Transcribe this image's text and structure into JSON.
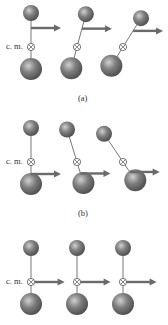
{
  "figure": {
    "cm_label": "c. m.",
    "panels": [
      {
        "id": "a",
        "label": "(a)",
        "description": "Force applied above center of mass: object rotates and translates",
        "frames": [
          {
            "tilt_deg": 0,
            "force_at": "above-cm"
          },
          {
            "tilt_deg": 15,
            "force_at": "above-cm"
          },
          {
            "tilt_deg": 32,
            "force_at": "above-cm"
          }
        ]
      },
      {
        "id": "b",
        "label": "(b)",
        "description": "Force applied below center of mass: object rotates the other way and translates",
        "frames": [
          {
            "tilt_deg": 0,
            "force_at": "below-cm"
          },
          {
            "tilt_deg": -17,
            "force_at": "below-cm"
          },
          {
            "tilt_deg": -34,
            "force_at": "below-cm"
          }
        ]
      },
      {
        "id": "c",
        "label": "",
        "description": "Force applied at center of mass: pure translation",
        "frames": [
          {
            "tilt_deg": 0,
            "force_at": "cm"
          },
          {
            "tilt_deg": 0,
            "force_at": "cm"
          },
          {
            "tilt_deg": 0,
            "force_at": "cm"
          }
        ]
      }
    ],
    "colors": {
      "sphere": "#6e6e6e",
      "sphere_highlight": "#c8c8c8",
      "arrow": "#6a6a6a",
      "rod": "#555555"
    }
  }
}
